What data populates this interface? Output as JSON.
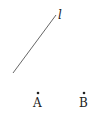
{
  "diagram": {
    "line": {
      "label": "l",
      "x1": 13,
      "y1": 73,
      "x2": 56,
      "y2": 15,
      "color": "#555555"
    },
    "points": [
      {
        "label": "A",
        "x": 38,
        "y": 93
      },
      {
        "label": "B",
        "x": 84,
        "y": 93
      }
    ]
  }
}
